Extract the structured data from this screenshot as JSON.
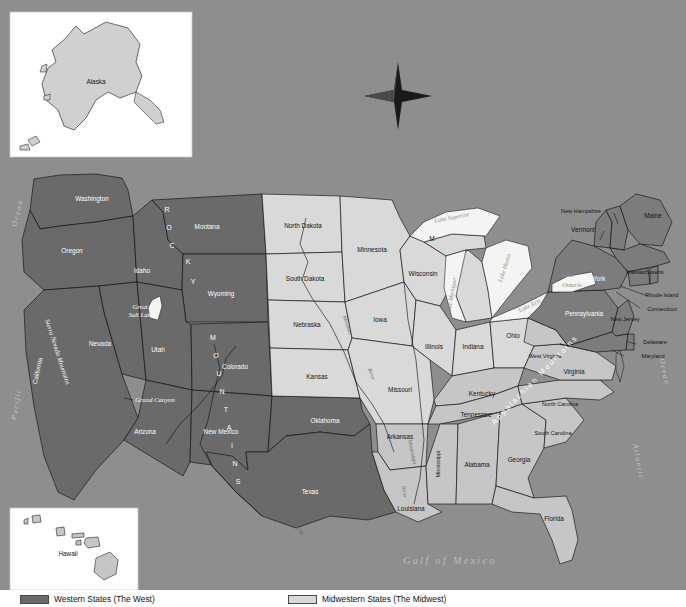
{
  "map": {
    "title": "Map of the United States",
    "compass": "compass-rose-north",
    "insets": [
      {
        "name": "alaska",
        "label": "Alaska"
      },
      {
        "name": "hawaii",
        "label": "Hawaii"
      }
    ],
    "water_bodies": [
      {
        "name": "pacific-ocean",
        "label": "Pacific Ocean"
      },
      {
        "name": "atlantic-ocean",
        "label": "Atlantic Ocean"
      },
      {
        "name": "gulf-of-mexico",
        "label": "Gulf of Mexico"
      },
      {
        "name": "lake-superior",
        "label": "Lake Superior"
      },
      {
        "name": "lake-michigan",
        "label": "Lake Michigan"
      },
      {
        "name": "lake-huron",
        "label": "Lake Huron"
      },
      {
        "name": "lake-erie",
        "label": "Lake Erie"
      },
      {
        "name": "lake-ontario",
        "label": "Lake Ontario"
      },
      {
        "name": "great-salt-lake",
        "label": "Great Salt Lake"
      }
    ],
    "physical_features": [
      {
        "name": "rocky-mountains",
        "label": "ROCKY MOUNTAINS"
      },
      {
        "name": "sierra-nevada-mountains",
        "label": "Sierra Nevada Mountains"
      },
      {
        "name": "appalachian-mountains",
        "label": "Appalachian Mountains"
      },
      {
        "name": "grand-canyon",
        "label": "Grand Canyon"
      },
      {
        "name": "missouri-river",
        "label": "Missouri River"
      },
      {
        "name": "mississippi-river",
        "label": "Mississippi River"
      },
      {
        "name": "rio-grande",
        "label": "Rio Grande"
      }
    ],
    "states": [
      {
        "name": "washington",
        "label": "Washington",
        "region": "west",
        "x": 92,
        "y": 199
      },
      {
        "name": "oregon",
        "label": "Oregon",
        "region": "west",
        "x": 72,
        "y": 251
      },
      {
        "name": "california",
        "label": "California",
        "region": "west",
        "x": 38,
        "y": 371
      },
      {
        "name": "nevada",
        "label": "Nevada",
        "region": "west",
        "x": 100,
        "y": 344
      },
      {
        "name": "idaho",
        "label": "Idaho",
        "region": "west",
        "x": 142,
        "y": 271
      },
      {
        "name": "montana",
        "label": "Montana",
        "region": "west",
        "x": 207,
        "y": 227
      },
      {
        "name": "wyoming",
        "label": "Wyoming",
        "region": "west",
        "x": 221,
        "y": 294
      },
      {
        "name": "utah",
        "label": "Utah",
        "region": "west",
        "x": 158,
        "y": 350
      },
      {
        "name": "colorado",
        "label": "Colorado",
        "region": "west",
        "x": 235,
        "y": 367
      },
      {
        "name": "arizona",
        "label": "Arizona",
        "region": "west",
        "x": 145,
        "y": 432
      },
      {
        "name": "new-mexico",
        "label": "New Mexico",
        "region": "west",
        "x": 221,
        "y": 432
      },
      {
        "name": "texas",
        "label": "Texas",
        "region": "west",
        "x": 310,
        "y": 492
      },
      {
        "name": "oklahoma",
        "label": "Oklahoma",
        "region": "west",
        "x": 325,
        "y": 421
      },
      {
        "name": "north-dakota",
        "label": "North Dakota",
        "region": "midwest",
        "x": 303,
        "y": 226
      },
      {
        "name": "south-dakota",
        "label": "South Dakota",
        "region": "midwest",
        "x": 305,
        "y": 279
      },
      {
        "name": "nebraska",
        "label": "Nebraska",
        "region": "midwest",
        "x": 307,
        "y": 325
      },
      {
        "name": "kansas",
        "label": "Kansas",
        "region": "midwest",
        "x": 317,
        "y": 377
      },
      {
        "name": "minnesota",
        "label": "Minnesota",
        "region": "midwest",
        "x": 369,
        "y": 250
      },
      {
        "name": "iowa",
        "label": "Iowa",
        "region": "midwest",
        "x": 380,
        "y": 320
      },
      {
        "name": "missouri",
        "label": "Missouri",
        "region": "midwest",
        "x": 400,
        "y": 390
      },
      {
        "name": "wisconsin",
        "label": "Wisconsin",
        "region": "midwest",
        "x": 421,
        "y": 274
      },
      {
        "name": "illinois",
        "label": "Illinois",
        "region": "midwest",
        "x": 432,
        "y": 347
      },
      {
        "name": "indiana",
        "label": "Indiana",
        "region": "midwest",
        "x": 473,
        "y": 347
      },
      {
        "name": "michigan",
        "label": "M",
        "region": "midwest",
        "x": 432,
        "y": 239
      },
      {
        "name": "ohio",
        "label": "Ohio",
        "region": "midwest",
        "x": 513,
        "y": 336
      },
      {
        "name": "kentucky",
        "label": "Kentucky",
        "region": "southeast",
        "x": 482,
        "y": 394
      },
      {
        "name": "tennessee",
        "label": "Tennessee",
        "region": "southeast",
        "x": 476,
        "y": 415
      },
      {
        "name": "arkansas",
        "label": "Arkansas",
        "region": "southeast",
        "x": 400,
        "y": 437
      },
      {
        "name": "louisiana",
        "label": "Louisiana",
        "region": "southeast",
        "x": 411,
        "y": 509
      },
      {
        "name": "mississippi",
        "label": "Mississippi",
        "region": "southeast",
        "x": 439,
        "y": 464
      },
      {
        "name": "alabama",
        "label": "Alabama",
        "region": "southeast",
        "x": 475,
        "y": 465
      },
      {
        "name": "georgia",
        "label": "Georgia",
        "region": "southeast",
        "x": 519,
        "y": 460
      },
      {
        "name": "florida",
        "label": "Florida",
        "region": "southeast",
        "x": 554,
        "y": 519
      },
      {
        "name": "south-carolina",
        "label": "South Carolina",
        "region": "southeast",
        "x": 550,
        "y": 434
      },
      {
        "name": "north-carolina",
        "label": "North Carolina",
        "region": "southeast",
        "x": 557,
        "y": 405
      },
      {
        "name": "virginia",
        "label": "Virginia",
        "region": "southeast",
        "x": 572,
        "y": 372
      },
      {
        "name": "west-virginia",
        "label": "West Virginia",
        "region": "southeast",
        "x": 543,
        "y": 357
      },
      {
        "name": "maryland",
        "label": "Maryland",
        "region": "northeast",
        "x": 648,
        "y": 353
      },
      {
        "name": "delaware",
        "label": "Delaware",
        "region": "northeast",
        "x": 646,
        "y": 340
      },
      {
        "name": "new-jersey",
        "label": "New Jersey",
        "region": "northeast",
        "x": 627,
        "y": 320
      },
      {
        "name": "pennsylvania",
        "label": "Pennsylvania",
        "region": "northeast",
        "x": 585,
        "y": 314
      },
      {
        "name": "new-york",
        "label": "New York",
        "region": "northeast",
        "x": 592,
        "y": 279
      },
      {
        "name": "connecticut",
        "label": "Connecticut",
        "region": "northeast",
        "x": 651,
        "y": 308
      },
      {
        "name": "rhode-island",
        "label": "Rhode Island",
        "region": "northeast",
        "x": 661,
        "y": 295
      },
      {
        "name": "massachusetts",
        "label": "Massachusetts",
        "region": "northeast",
        "x": 645,
        "y": 277
      },
      {
        "name": "vermont",
        "label": "Vermont",
        "region": "northeast",
        "x": 586,
        "y": 230
      },
      {
        "name": "new-hampshire",
        "label": "New Hampshire",
        "region": "northeast",
        "x": 581,
        "y": 212
      },
      {
        "name": "maine",
        "label": "Maine",
        "region": "northeast",
        "x": 651,
        "y": 216
      }
    ],
    "legend": {
      "items": [
        {
          "name": "legend-western-states",
          "label": "Western States (The West)",
          "color": "#6a6a6a"
        },
        {
          "name": "legend-midwestern-states",
          "label": "Midwestern States (The Midwest)",
          "color": "#d9d9d9"
        }
      ]
    },
    "colors": {
      "background": "#8e8e8e",
      "west": "#6a6a6a",
      "midwest": "#d9d9d9",
      "southeast": "#c6c6c6",
      "northeast": "#7c7c7c",
      "water": "#f4f4f2",
      "border": "#111111",
      "inset_frame": "#ffffff"
    }
  }
}
